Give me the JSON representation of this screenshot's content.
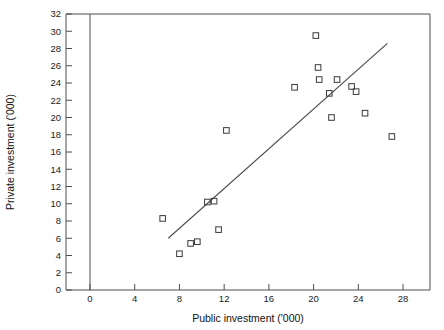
{
  "chart_data": {
    "type": "scatter",
    "title": "",
    "xlabel": "Public investment ('000)",
    "ylabel": "Private investment ('000)",
    "xlim": [
      -2,
      30.4
    ],
    "ylim": [
      0,
      32
    ],
    "xticks": [
      0,
      4,
      8,
      12,
      16,
      20,
      24,
      28
    ],
    "yticks": [
      0,
      2,
      4,
      6,
      8,
      10,
      12,
      14,
      16,
      18,
      20,
      22,
      24,
      26,
      28,
      30,
      32
    ],
    "xtick_labels": [
      "0",
      "4",
      "8",
      "12",
      "16",
      "20",
      "24",
      "28"
    ],
    "ytick_labels": [
      "0",
      "2",
      "4",
      "6",
      "8",
      "10",
      "12",
      "14",
      "16",
      "18",
      "20",
      "22",
      "24",
      "26",
      "28",
      "30",
      "32"
    ],
    "grid": false,
    "legend": false,
    "marker_style": "open-square",
    "points": [
      {
        "x": 6.5,
        "y": 8.3
      },
      {
        "x": 8.0,
        "y": 4.2
      },
      {
        "x": 9.0,
        "y": 5.4
      },
      {
        "x": 9.6,
        "y": 5.6
      },
      {
        "x": 10.5,
        "y": 10.2
      },
      {
        "x": 11.1,
        "y": 10.3
      },
      {
        "x": 11.5,
        "y": 7.0
      },
      {
        "x": 12.2,
        "y": 18.5
      },
      {
        "x": 18.3,
        "y": 23.5
      },
      {
        "x": 20.2,
        "y": 29.5
      },
      {
        "x": 20.4,
        "y": 25.8
      },
      {
        "x": 20.5,
        "y": 24.4
      },
      {
        "x": 21.4,
        "y": 22.8
      },
      {
        "x": 21.6,
        "y": 20.0
      },
      {
        "x": 22.1,
        "y": 24.4
      },
      {
        "x": 23.4,
        "y": 23.6
      },
      {
        "x": 23.8,
        "y": 23.0
      },
      {
        "x": 24.6,
        "y": 20.5
      },
      {
        "x": 27.0,
        "y": 17.8
      }
    ],
    "trendline": {
      "type": "linear-fit",
      "x_start": 7.0,
      "y_start": 6.0,
      "x_end": 26.6,
      "y_end": 28.6
    },
    "colors": {
      "marker_stroke": "#3a3a3a",
      "trend_line": "#4a4a4a",
      "axis": "#4d4d4d",
      "text": "#111111",
      "background": "#ffffff"
    }
  }
}
